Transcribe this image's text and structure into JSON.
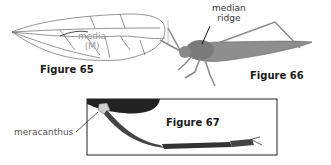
{
  "figures": [
    {
      "id": "65",
      "label": "Figure 65",
      "subject": "wing venation",
      "annotations": [
        {
          "text": "media",
          "line2": "(M)"
        }
      ]
    },
    {
      "id": "66",
      "label": "Figure 66",
      "subject": "grasshopper",
      "annotations": [
        {
          "text": "median",
          "line2": "ridge"
        }
      ]
    },
    {
      "id": "67",
      "label": "Figure 67",
      "subject": "hind leg",
      "annotations": [
        {
          "text": "meracanthus"
        }
      ]
    }
  ],
  "colors": {
    "line": "#555555",
    "body": "#8a8a8a",
    "dark": "#222222",
    "text": "#1a1a1a"
  }
}
